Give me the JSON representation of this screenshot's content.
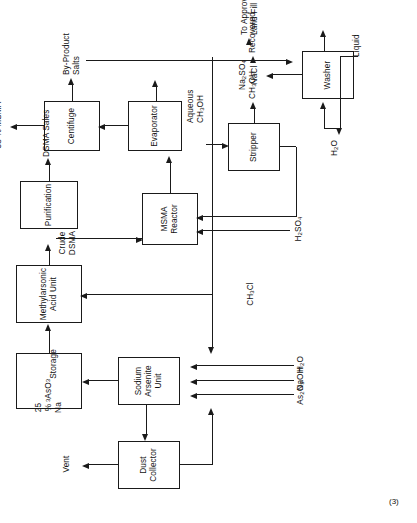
{
  "figure": {
    "caption": "(3)",
    "orientation": "rotated-90-ccw",
    "line_color": "#1a1a1a",
    "background": "#ffffff"
  },
  "units": [
    {
      "id": "dust-collector",
      "label": "Dust\nCollector"
    },
    {
      "id": "sodium-arsenite-unit",
      "label": "Sodium\nArsenite\nUnit"
    },
    {
      "id": "storage",
      "label": "25 % Na3AsO3\nStorage"
    },
    {
      "id": "methylarsonic-acid",
      "label": "Methylarsonic\nAcid Unit"
    },
    {
      "id": "purification",
      "label": "Purification"
    },
    {
      "id": "msma-reactor",
      "label": "MSMA\nReactor"
    },
    {
      "id": "evaporator",
      "label": "Evaporator"
    },
    {
      "id": "centrifuge",
      "label": "Centifuge"
    },
    {
      "id": "stripper",
      "label": "Stripper"
    },
    {
      "id": "washer",
      "label": "Washer"
    }
  ],
  "streams": {
    "feed_as2o3": "As2O3",
    "feed_naoh": "NaOH",
    "feed_h2o": "H2O",
    "feed_ch3cl": "CH3Cl",
    "feed_h2so4": "H2SO4",
    "vent": "Vent",
    "crude_dsma": "Crude\nDSMA",
    "dsma_sales": "DSMA Sales",
    "msma_58": "58 % MSMA",
    "byproduct_salts": "By-Product\nSalts",
    "aqueous_ch3oh": "Aqueous\nCH3OH",
    "ch3oh": "CH3OH",
    "recovered": "Recovered",
    "washer_water": "H2O",
    "salt_cake_a": "Na2SO4",
    "salt_cake_b": "NaCl",
    "land_fill": "To Approved\nLand Fill",
    "liquid": "Liquid"
  }
}
